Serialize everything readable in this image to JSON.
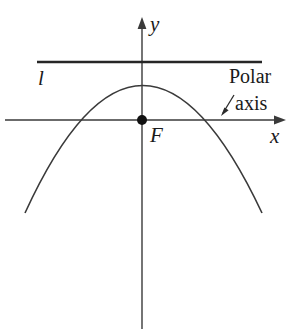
{
  "figure": {
    "type": "geometry-diagram",
    "background_color": "#ffffff",
    "stroke_color": "#3a3a3a",
    "text_color": "#1a1a1a"
  },
  "labels": {
    "y_axis": "y",
    "x_axis": "x",
    "directrix": "l",
    "focus": "F",
    "polar": "Polar",
    "axis": "axis"
  },
  "elements": {
    "y_axis_name": "y-axis",
    "x_axis_name": "x-axis",
    "directrix_name": "directrix-line",
    "curve_name": "parabola-curve",
    "focus_point_name": "focus-point",
    "pointer_name": "polar-axis-pointer"
  },
  "geometry": {
    "origin": [
      142,
      120
    ],
    "vertex": [
      142,
      86
    ],
    "x_axis_from": [
      5,
      120
    ],
    "x_axis_to": [
      286,
      120
    ],
    "y_axis_from": [
      142,
      18
    ],
    "y_axis_to": [
      142,
      329
    ],
    "directrix_from": [
      37,
      62
    ],
    "directrix_to": [
      262,
      62
    ],
    "curve_left_end": [
      25,
      213
    ],
    "curve_right_end": [
      262,
      213
    ],
    "x_intercepts": [
      95,
      190
    ],
    "pointer_from": [
      233,
      96
    ],
    "pointer_to": [
      222,
      114
    ]
  }
}
